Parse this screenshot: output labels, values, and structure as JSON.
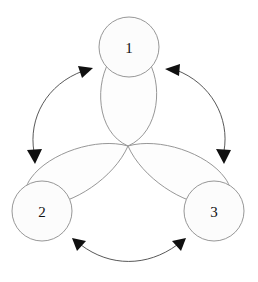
{
  "diagram": {
    "type": "node-petal-cycle",
    "background_color": "#ffffff",
    "stroke_color": "#8b8b8b",
    "arrow_color": "#101010",
    "petal_fill": "#fdfdfd",
    "node_fill": "#fcfcfc",
    "nodes": [
      {
        "id": "node-1",
        "label": "1",
        "cx": 129,
        "cy": 47,
        "r": 30
      },
      {
        "id": "node-2",
        "label": "2",
        "cx": 42,
        "cy": 211,
        "r": 30
      },
      {
        "id": "node-3",
        "label": "3",
        "cx": 214,
        "cy": 211,
        "r": 30
      }
    ],
    "petals": [
      {
        "id": "petal-top",
        "points_to": "node-1",
        "angle_deg": 270
      },
      {
        "id": "petal-lower-left",
        "points_to": "node-2",
        "angle_deg": 150
      },
      {
        "id": "petal-lower-right",
        "points_to": "node-3",
        "angle_deg": 30
      }
    ],
    "arrows": [
      {
        "id": "arrow-1-2",
        "connects": "node-1 and node-2",
        "double_headed": true,
        "side": "left"
      },
      {
        "id": "arrow-1-3",
        "connects": "node-1 and node-3",
        "double_headed": true,
        "side": "right"
      },
      {
        "id": "arrow-2-3",
        "connects": "node-2 and node-3",
        "double_headed": true,
        "side": "bottom"
      }
    ],
    "center": {
      "x": 128,
      "y": 146
    }
  }
}
